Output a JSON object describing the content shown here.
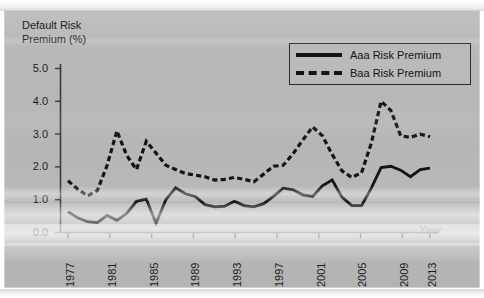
{
  "figure": {
    "y_axis_title": "Default Risk\nPremium (%)",
    "x_axis_title": "Year"
  },
  "legend": {
    "entries": [
      {
        "label": "Aaa Risk Premium",
        "style": "solid",
        "key_icon": "solid-line-icon",
        "color": "#141414"
      },
      {
        "label": "Baa Risk Premium",
        "style": "dashed",
        "key_icon": "dashed-line-icon",
        "color": "#141414"
      }
    ]
  },
  "axes": {
    "y_ticks": [
      "0.0",
      "1.0",
      "2.0",
      "3.0",
      "4.0",
      "5.0"
    ],
    "x_ticks": [
      "1977",
      "1981",
      "1985",
      "1989",
      "1993",
      "1997",
      "2001",
      "2005",
      "2009",
      "2013"
    ]
  },
  "chart_data": {
    "type": "line",
    "title": "",
    "xlabel": "Year",
    "ylabel": "Default Risk Premium (%)",
    "xlim": [
      1977,
      2014
    ],
    "ylim": [
      0.0,
      5.0
    ],
    "ytick_interval": 1.0,
    "xtick_interval": 4,
    "grid": false,
    "legend_position": "top-right",
    "x": [
      1977,
      1978,
      1979,
      1980,
      1981,
      1982,
      1983,
      1984,
      1985,
      1986,
      1987,
      1988,
      1989,
      1990,
      1991,
      1992,
      1993,
      1994,
      1995,
      1996,
      1997,
      1998,
      1999,
      2000,
      2001,
      2002,
      2003,
      2004,
      2005,
      2006,
      2007,
      2008,
      2009,
      2010,
      2011,
      2012,
      2013,
      2014
    ],
    "series": [
      {
        "name": "Aaa Risk Premium",
        "style": "solid",
        "color": "#141414",
        "values": [
          0.63,
          0.45,
          0.33,
          0.3,
          0.52,
          0.37,
          0.58,
          0.95,
          1.02,
          0.28,
          1.0,
          1.36,
          1.18,
          1.1,
          0.85,
          0.78,
          0.8,
          0.95,
          0.82,
          0.78,
          0.88,
          1.1,
          1.35,
          1.3,
          1.15,
          1.1,
          1.42,
          1.6,
          1.08,
          0.82,
          0.82,
          1.35,
          1.98,
          2.02,
          1.9,
          1.7,
          1.92,
          1.96
        ]
      },
      {
        "name": "Baa Risk Premium",
        "style": "dashed",
        "color": "#141414",
        "values": [
          1.58,
          1.32,
          1.12,
          1.28,
          2.05,
          3.1,
          2.35,
          1.92,
          2.78,
          2.42,
          2.05,
          1.92,
          1.8,
          1.75,
          1.7,
          1.6,
          1.62,
          1.68,
          1.62,
          1.55,
          1.78,
          2.02,
          2.05,
          2.4,
          2.82,
          3.22,
          2.95,
          2.38,
          1.88,
          1.68,
          1.82,
          2.72,
          4.0,
          3.72,
          2.95,
          2.9,
          3.0,
          2.92
        ]
      }
    ]
  }
}
